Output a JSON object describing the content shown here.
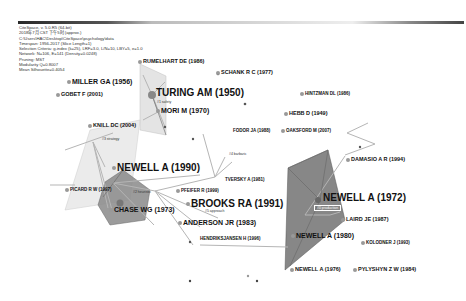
{
  "header": {
    "info_lines": [
      "CiteSpace, v. 5.0.R5 (64-bit)",
      "2018年7月 CST 下午5时 (approx.)",
      "C:\\Users\\HAC\\Desktop\\CiteSpace\\psychology\\data",
      "Timespan: 1956-2017 (Slice Length=1)",
      "Selection Criteria: g-index (k=25), LRF=3.0, L/N=10, LBY=5, e=1.0",
      "Network: N=106, E=141 (Density=0.0248)",
      "Pruning: MST",
      "Modularity Q=0.8007",
      "Mean Silhouette=0.4054"
    ]
  },
  "nodes": [
    {
      "id": "rumelhart",
      "label": "RUMELHART DE (1986)",
      "size": "s3"
    },
    {
      "id": "schank",
      "label": "SCHANK R C (1977)",
      "size": "s3"
    },
    {
      "id": "miller",
      "label": "MILLER GA (1956)",
      "size": "s2"
    },
    {
      "id": "gobet",
      "label": "GOBET F (2001)",
      "size": "s3"
    },
    {
      "id": "turing",
      "label": "TURING AM (1950)",
      "size": "s1"
    },
    {
      "id": "hintzman",
      "label": "HINTZMAN DL (1986)",
      "size": "s4"
    },
    {
      "id": "mori",
      "label": "MORI M (1970)",
      "size": "s2"
    },
    {
      "id": "hebb",
      "label": "HEBB D (1949)",
      "size": "s3"
    },
    {
      "id": "knill",
      "label": "KNILL DC (2004)",
      "size": "s3"
    },
    {
      "id": "fodor",
      "label": "FODOR JA (1988)",
      "size": "s4"
    },
    {
      "id": "oaksford",
      "label": "OAKSFORD M (2007)",
      "size": "s4"
    },
    {
      "id": "damasio",
      "label": "DAMASIO A R (1994)",
      "size": "s3"
    },
    {
      "id": "newell1990",
      "label": "NEWELL A (1990)",
      "size": "s1"
    },
    {
      "id": "tversky",
      "label": "TVERSKY A (1981)",
      "size": "s4"
    },
    {
      "id": "picard",
      "label": "PICARD R W (1997)",
      "size": "s4"
    },
    {
      "id": "pfeifer",
      "label": "PFEIFER R (1999)",
      "size": "s4"
    },
    {
      "id": "newell1972",
      "label": "NEWELL A (1972)",
      "size": "s1"
    },
    {
      "id": "chase",
      "label": "CHASE WG (1973)",
      "size": "s2"
    },
    {
      "id": "brooks",
      "label": "BROOKS RA (1991)",
      "size": "s1"
    },
    {
      "id": "laird",
      "label": "LAIRD JE (1987)",
      "size": "s3"
    },
    {
      "id": "anderson",
      "label": "ANDERSON JR (1983)",
      "size": "s2"
    },
    {
      "id": "hendriks",
      "label": "HENDRIKSJANSEN H (1996)",
      "size": "s4"
    },
    {
      "id": "newell1980",
      "label": "NEWELL A (1980)",
      "size": "s2"
    },
    {
      "id": "kolodner",
      "label": "KOLODNER J (1993)",
      "size": "s4"
    },
    {
      "id": "newell1976",
      "label": "NEWELL A (1976)",
      "size": "s3"
    },
    {
      "id": "pylyshyn",
      "label": "PYLYSHYN Z W (1984)",
      "size": "s3"
    }
  ],
  "clusters": [
    {
      "id": "c_safety",
      "label": "#1 safety"
    },
    {
      "id": "c_strategy",
      "label": "#3 strategy"
    },
    {
      "id": "c_heuristic",
      "label": "#2 heuristic"
    },
    {
      "id": "c_barbaric",
      "label": "#4 barbaric"
    },
    {
      "id": "c_approach",
      "label": "#5 approach"
    },
    {
      "id": "c_production",
      "label": "#0 production"
    }
  ]
}
